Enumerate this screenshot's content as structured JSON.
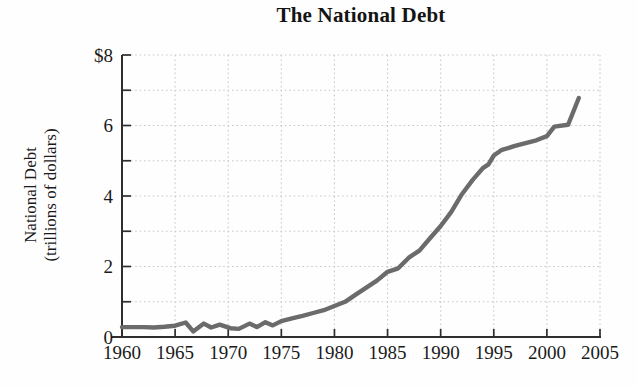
{
  "figure": {
    "title": "The National Debt",
    "y_axis_label_line1": "National Debt",
    "y_axis_label_line2": "(trillions of dollars)"
  },
  "chart_data": {
    "type": "line",
    "title": "The National Debt",
    "xlabel": "",
    "ylabel": "National Debt (trillions of dollars)",
    "xlim": [
      1960,
      2005
    ],
    "ylim": [
      0,
      8
    ],
    "x_ticks": [
      1960,
      1965,
      1970,
      1975,
      1980,
      1985,
      1990,
      1995,
      2000,
      2005
    ],
    "x_tick_labels": [
      "1960",
      "1965",
      "1970",
      "1975",
      "1980",
      "1985",
      "1990",
      "1995",
      "2000",
      "2005"
    ],
    "y_label_ticks": [
      0,
      2,
      4,
      6,
      8
    ],
    "y_tick_labels": [
      "0",
      "2",
      "4",
      "6",
      "$8"
    ],
    "y_minor_tick_step": 1,
    "grid": "dotted, every 1 unit horizontal, every 5 years vertical",
    "legend_position": "none",
    "series": [
      {
        "name": "National Debt",
        "x": [
          1960,
          1961,
          1962,
          1963,
          1964,
          1965,
          1966,
          1966.7,
          1967.7,
          1968.4,
          1969.2,
          1970.2,
          1971,
          1972,
          1972.7,
          1973.5,
          1974.2,
          1975,
          1976,
          1977,
          1978,
          1979,
          1980,
          1981,
          1982,
          1983,
          1984,
          1985,
          1986,
          1987,
          1988,
          1989,
          1990,
          1991,
          1992,
          1993,
          1994,
          1994.5,
          1995,
          1995.7,
          1997,
          1998,
          1999,
          2000,
          2000.7,
          2002,
          2003
        ],
        "y": [
          0.28,
          0.28,
          0.28,
          0.27,
          0.29,
          0.32,
          0.41,
          0.16,
          0.38,
          0.27,
          0.35,
          0.25,
          0.23,
          0.38,
          0.28,
          0.42,
          0.33,
          0.45,
          0.53,
          0.6,
          0.68,
          0.76,
          0.88,
          1.0,
          1.2,
          1.4,
          1.6,
          1.85,
          1.95,
          2.25,
          2.45,
          2.8,
          3.15,
          3.55,
          4.05,
          4.45,
          4.8,
          4.9,
          5.15,
          5.3,
          5.42,
          5.5,
          5.58,
          5.7,
          5.97,
          6.02,
          6.78
        ]
      }
    ],
    "colors": {
      "line": "#6b6b6b",
      "axis": "#2e2e2e",
      "grid": "#c9c9c9",
      "text": "#1a1a1a",
      "background": "#fefefe"
    }
  }
}
